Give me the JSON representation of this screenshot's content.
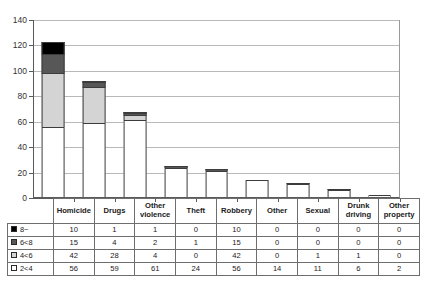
{
  "chart_data": {
    "type": "bar",
    "title": "",
    "xlabel": "",
    "ylabel": "",
    "ylim": [
      0,
      140
    ],
    "ytick_step": 20,
    "yticks": [
      0,
      20,
      40,
      60,
      80,
      100,
      120,
      140
    ],
    "grid": true,
    "stacked": true,
    "legend_position": "table-row-headers",
    "categories": [
      "Homicide",
      "Drugs",
      "Other violence",
      "Theft",
      "Robbery",
      "Other",
      "Sexual",
      "Drunk driving",
      "Other property"
    ],
    "series": [
      {
        "name": "2<4",
        "color": "#ffffff",
        "values": [
          56,
          59,
          61,
          24,
          56,
          14,
          11,
          6,
          2
        ],
        "plotted": [
          56,
          59,
          61,
          24,
          21,
          14,
          11,
          6,
          2
        ]
      },
      {
        "name": "4<6",
        "color": "#d4d4d4",
        "values": [
          42,
          28,
          4,
          0,
          42,
          0,
          1,
          1,
          0
        ],
        "plotted": [
          42,
          28,
          4,
          0,
          0,
          0,
          1,
          1,
          0
        ]
      },
      {
        "name": "6<8",
        "color": "#575757",
        "values": [
          15,
          4,
          2,
          1,
          15,
          0,
          0,
          0,
          0
        ],
        "plotted": [
          15,
          4,
          2,
          1,
          2,
          0,
          0,
          0,
          0
        ]
      },
      {
        "name": "8~",
        "color": "#000000",
        "values": [
          10,
          1,
          1,
          0,
          10,
          0,
          0,
          0,
          0
        ],
        "plotted": [
          10,
          1,
          1,
          0,
          0,
          0,
          0,
          0,
          0
        ]
      }
    ],
    "totals_plotted": [
      123,
      92,
      68,
      25,
      23,
      14,
      12,
      7,
      2
    ]
  },
  "table": {
    "corner_label": "",
    "column_headers": [
      "Homicide",
      "Drugs",
      "Other violence",
      "Theft",
      "Robbery",
      "Other",
      "Sexual",
      "Drunk driving",
      "Other property"
    ],
    "rows": [
      {
        "key": "8~",
        "swatch": "#000000",
        "values": [
          "10",
          "1",
          "1",
          "0",
          "10",
          "0",
          "0",
          "0",
          "0"
        ]
      },
      {
        "key": "6<8",
        "swatch": "#575757",
        "values": [
          "15",
          "4",
          "2",
          "1",
          "15",
          "0",
          "0",
          "0",
          "0"
        ]
      },
      {
        "key": "4<6",
        "swatch": "#d4d4d4",
        "values": [
          "42",
          "28",
          "4",
          "0",
          "42",
          "0",
          "1",
          "1",
          "0"
        ]
      },
      {
        "key": "2<4",
        "swatch": "#ffffff",
        "values": [
          "56",
          "59",
          "61",
          "24",
          "56",
          "14",
          "11",
          "6",
          "2"
        ]
      }
    ]
  }
}
